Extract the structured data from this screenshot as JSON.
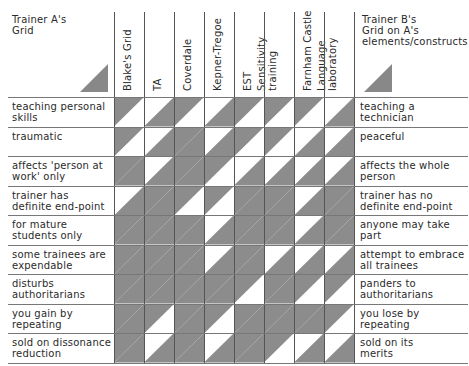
{
  "left_header": {
    "line1": "Trainer A's",
    "line2": "Grid"
  },
  "right_header": {
    "line1": "Trainer B's",
    "line2": "Grid on A's",
    "line3": "elements/constructs"
  },
  "columns": [
    {
      "line1": "Blake's Grid",
      "line2": ""
    },
    {
      "line1": "TA",
      "line2": ""
    },
    {
      "line1": "Coverdale",
      "line2": ""
    },
    {
      "line1": "Kepner-Tregoe",
      "line2": ""
    },
    {
      "line1": "EST",
      "line2": ""
    },
    {
      "line1": "Sensitivity",
      "line2": "training"
    },
    {
      "line1": "Farnham Castle",
      "line2": ""
    },
    {
      "line1": "Language",
      "line2": "laboratory"
    }
  ],
  "rows": [
    {
      "left1": "teaching personal",
      "left2": "skills",
      "right1": "teaching a",
      "right2": "technician",
      "cells": [
        [
          1,
          0
        ],
        [
          0,
          1
        ],
        [
          1,
          0
        ],
        [
          0,
          1
        ],
        [
          1,
          0
        ],
        [
          1,
          0
        ],
        [
          1,
          0
        ],
        [
          0,
          1
        ]
      ]
    },
    {
      "left1": "traumatic",
      "left2": "",
      "right1": "peaceful",
      "right2": "",
      "cells": [
        [
          1,
          0
        ],
        [
          0,
          1
        ],
        [
          1,
          1
        ],
        [
          0,
          1
        ],
        [
          1,
          0
        ],
        [
          1,
          0
        ],
        [
          0,
          1
        ],
        [
          0,
          1
        ]
      ]
    },
    {
      "left1": "affects 'person at",
      "left2": "work' only",
      "right1": "affects the whole",
      "right2": "person",
      "cells": [
        [
          1,
          1
        ],
        [
          0,
          1
        ],
        [
          1,
          1
        ],
        [
          1,
          0
        ],
        [
          0,
          1
        ],
        [
          0,
          1
        ],
        [
          0,
          1
        ],
        [
          0,
          1
        ]
      ]
    },
    {
      "left1": "trainer has",
      "left2": "definite end-point",
      "right1": "trainer has no",
      "right2": "definite end-point",
      "cells": [
        [
          0,
          1
        ],
        [
          1,
          1
        ],
        [
          1,
          0
        ],
        [
          1,
          0
        ],
        [
          1,
          1
        ],
        [
          1,
          1
        ],
        [
          0,
          1
        ],
        [
          1,
          1
        ]
      ]
    },
    {
      "left1": "for mature",
      "left2": "students only",
      "right1": "anyone may take",
      "right2": "part",
      "cells": [
        [
          1,
          1
        ],
        [
          1,
          1
        ],
        [
          1,
          1
        ],
        [
          0,
          1
        ],
        [
          1,
          1
        ],
        [
          1,
          1
        ],
        [
          0,
          1
        ],
        [
          1,
          1
        ]
      ]
    },
    {
      "left1": "some trainees are",
      "left2": "expendable",
      "right1": "attempt to embrace",
      "right2": "all trainees",
      "cells": [
        [
          1,
          1
        ],
        [
          1,
          1
        ],
        [
          1,
          1
        ],
        [
          0,
          1
        ],
        [
          1,
          1
        ],
        [
          0,
          1
        ],
        [
          0,
          1
        ],
        [
          0,
          1
        ]
      ]
    },
    {
      "left1": "disturbs",
      "left2": "authoritarians",
      "right1": "panders to",
      "right2": "authoritarians",
      "cells": [
        [
          1,
          1
        ],
        [
          1,
          1
        ],
        [
          1,
          1
        ],
        [
          1,
          1
        ],
        [
          1,
          0
        ],
        [
          1,
          1
        ],
        [
          1,
          0
        ],
        [
          1,
          0
        ]
      ]
    },
    {
      "left1": "you gain by",
      "left2": "repeating",
      "right1": "you lose by",
      "right2": "repeating",
      "cells": [
        [
          1,
          1
        ],
        [
          1,
          0
        ],
        [
          1,
          1
        ],
        [
          1,
          0
        ],
        [
          1,
          1
        ],
        [
          1,
          1
        ],
        [
          1,
          1
        ],
        [
          1,
          0
        ]
      ]
    },
    {
      "left1": "sold on dissonance",
      "left2": "reduction",
      "right1": "sold on its",
      "right2": "merits",
      "cells": [
        [
          1,
          1
        ],
        [
          0,
          1
        ],
        [
          1,
          1
        ],
        [
          0,
          1
        ],
        [
          1,
          1
        ],
        [
          1,
          0
        ],
        [
          0,
          1
        ],
        [
          0,
          1
        ]
      ]
    }
  ],
  "colors": {
    "shade": "#8c8c8c",
    "paper": "#ffffff",
    "line": "#444444",
    "legend": "#888888"
  }
}
